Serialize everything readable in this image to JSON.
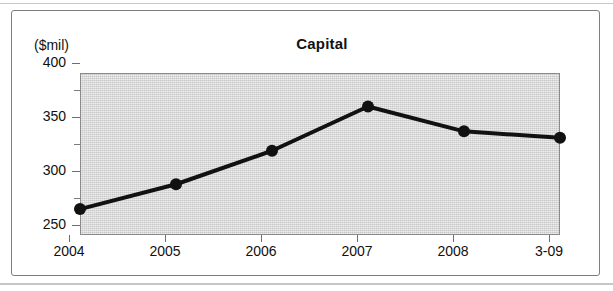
{
  "figure": {
    "title": "Capital",
    "y_unit_label": "($mil)"
  },
  "chart_data": {
    "type": "line",
    "title": "Capital",
    "xlabel": "",
    "ylabel": "($mil)",
    "ylim": [
      250,
      400
    ],
    "yticks": [
      250,
      300,
      350,
      400
    ],
    "yticks_minor": [
      275,
      325,
      375
    ],
    "grid": false,
    "legend": null,
    "categories": [
      "2004",
      "2005",
      "2006",
      "2007",
      "2008",
      "3-09"
    ],
    "values": [
      274,
      297,
      328,
      369,
      346,
      340
    ],
    "series": [
      {
        "name": "Capital",
        "values": [
          274,
          297,
          328,
          369,
          346,
          340
        ],
        "color": "#111111",
        "marker": "circle",
        "line_width": 4
      }
    ],
    "plot_background": "#d9d9d9"
  },
  "colors": {
    "line": "#111111",
    "marker": "#111111",
    "plot_bg": "#d9d9d9",
    "frame": "#7d7d7d",
    "axis": "#6f6f6f",
    "text": "#111111"
  }
}
